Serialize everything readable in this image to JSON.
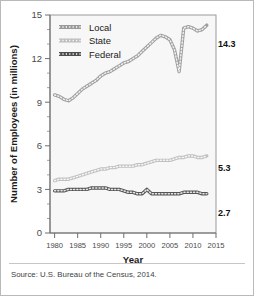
{
  "figure": {
    "source_note": "Source: U.S. Bureau of the Census, 2014.",
    "background": "#ffffff",
    "border_color": "#b9b9b9"
  },
  "chart_data": {
    "type": "line",
    "title": "",
    "xlabel": "Year",
    "ylabel": "Number of Employees (in millions)",
    "xlim": [
      1979,
      2015
    ],
    "ylim": [
      0,
      15
    ],
    "xticks": [
      1980,
      1985,
      1990,
      1995,
      2000,
      2005,
      2010,
      2015
    ],
    "yticks": [
      0,
      3,
      6,
      9,
      12,
      15
    ],
    "y_minor_step": 1,
    "grid": false,
    "legend_position": "top-left",
    "x": [
      1980,
      1981,
      1982,
      1983,
      1984,
      1985,
      1986,
      1987,
      1988,
      1989,
      1990,
      1991,
      1992,
      1993,
      1994,
      1995,
      1996,
      1997,
      1998,
      1999,
      2000,
      2001,
      2002,
      2003,
      2004,
      2005,
      2006,
      2007,
      2008,
      2009,
      2010,
      2011,
      2012,
      2013
    ],
    "series": [
      {
        "name": "Local",
        "color": "#9a9a9a",
        "end_label": "14.3",
        "values": [
          9.5,
          9.4,
          9.2,
          9.1,
          9.3,
          9.6,
          9.9,
          10.1,
          10.3,
          10.5,
          10.8,
          11.0,
          11.1,
          11.3,
          11.5,
          11.7,
          11.8,
          12.0,
          12.2,
          12.5,
          12.8,
          13.1,
          13.4,
          13.6,
          13.5,
          13.3,
          12.6,
          11.1,
          14.1,
          14.2,
          14.1,
          13.9,
          14.0,
          14.3
        ]
      },
      {
        "name": "State",
        "color": "#bdbdbd",
        "end_label": "5.3",
        "values": [
          3.6,
          3.7,
          3.7,
          3.7,
          3.8,
          3.9,
          4.0,
          4.1,
          4.2,
          4.3,
          4.4,
          4.4,
          4.5,
          4.5,
          4.6,
          4.6,
          4.6,
          4.6,
          4.7,
          4.7,
          4.8,
          4.9,
          5.0,
          5.0,
          5.0,
          5.0,
          5.1,
          5.2,
          5.2,
          5.3,
          5.3,
          5.2,
          5.2,
          5.3
        ]
      },
      {
        "name": "Federal",
        "color": "#4d4d4d",
        "end_label": "2.7",
        "values": [
          2.9,
          2.9,
          2.9,
          3.0,
          3.0,
          3.0,
          3.0,
          3.0,
          3.1,
          3.1,
          3.1,
          3.1,
          3.0,
          3.0,
          3.0,
          2.9,
          2.8,
          2.8,
          2.7,
          2.7,
          3.0,
          2.7,
          2.7,
          2.7,
          2.7,
          2.7,
          2.7,
          2.7,
          2.8,
          2.8,
          2.8,
          2.8,
          2.7,
          2.7
        ]
      }
    ],
    "legend": [
      {
        "label": "Local",
        "color": "#9a9a9a"
      },
      {
        "label": "State",
        "color": "#bdbdbd"
      },
      {
        "label": "Federal",
        "color": "#4d4d4d"
      }
    ]
  }
}
